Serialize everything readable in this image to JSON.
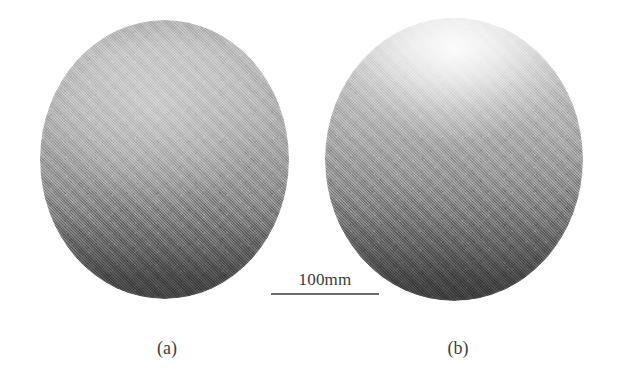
{
  "figure": {
    "kind": "photographic-figure",
    "background_color": "#ffffff",
    "description_type": "two-panel grayscale photograph of spherical specimens"
  },
  "panels": [
    {
      "id": "a",
      "caption": "(a)",
      "shape": "sphere",
      "surface_tone": "uniform medium gray with diffuse top lighting",
      "top_tone_hex": "#bcbcbc",
      "mid_tone_hex": "#aeaeae",
      "bottom_tone_hex": "#464646",
      "highlight": "broad diffuse highlight, upper-center",
      "highlight_intensity": "low"
    },
    {
      "id": "b",
      "caption": "(b)",
      "shape": "sphere",
      "surface_tone": "bright specular top grading to dark bottom",
      "top_tone_hex": "#e9e9e9",
      "mid_tone_hex": "#a3a3a3",
      "bottom_tone_hex": "#414141",
      "highlight": "bright concentrated specular highlight at top pole",
      "highlight_intensity": "high"
    }
  ],
  "scale_bar": {
    "label": "100mm",
    "value": 100,
    "unit": "mm",
    "rule_color": "#6b6b6b"
  }
}
